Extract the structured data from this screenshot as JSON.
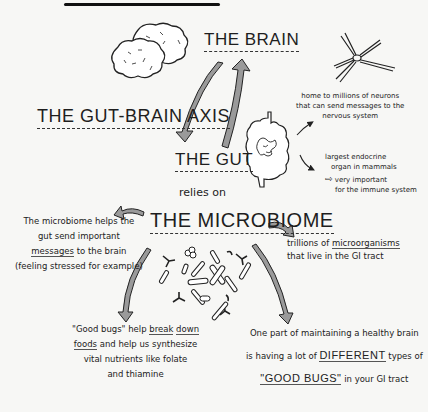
{
  "titles": {
    "brain": "THE BRAIN",
    "axis": "THE GUT-BRAIN AXIS",
    "gut": "THE GUT",
    "relies": "relies on",
    "microbiome": "THE MICROBIOME"
  },
  "gut_notes": {
    "neurons": [
      "home to millions of neurons",
      "that can send messages to the",
      "nervous system"
    ],
    "endocrine": [
      "largest endocrine",
      "organ in mammals"
    ],
    "immune_arrow": "⇨",
    "immune": [
      "very important",
      "for the immune system"
    ]
  },
  "microbiome_notes": {
    "messages": {
      "line1": "The microbiome helps the",
      "line2": "gut send important",
      "line3_u": "messages",
      "line3_rest": " to the brain",
      "line4": "(feeling stressed for example)"
    },
    "trillions": {
      "line1_pre": "trillions of ",
      "line1_u": "microorganisms",
      "line2": "that live in the GI tract"
    },
    "good_bugs": {
      "line1_pre": "\"Good bugs\" help ",
      "line1_u1": "break",
      "line1_sp": " ",
      "line1_u2": "down",
      "line2_u": "foods",
      "line2_rest": " and help us synthesize",
      "line3": "vital nutrients like folate",
      "line4": "and thiamine"
    },
    "healthy_brain": {
      "line1": "One part of maintaining a healthy brain",
      "line2_pre": "is having a lot of ",
      "line2_u": "DIFFERENT",
      "line2_post": " types of",
      "line3_u": "\"GOOD BUGS\"",
      "line3_post": " in your GI tract"
    }
  },
  "icons": [
    "brain-icon",
    "neuron-icon",
    "intestine-icon",
    "bacteria-cluster-icon",
    "curved-arrow-icon"
  ],
  "colors": {
    "ink": "#1a1a1a",
    "arrow_fill": "#9a9a9a",
    "background": "#f7f7f5"
  }
}
